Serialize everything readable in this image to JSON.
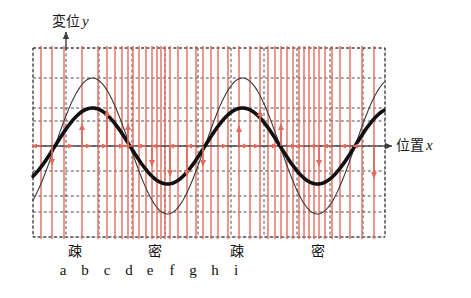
{
  "figure": {
    "axes": {
      "y_label_text": "変位",
      "y_label_var": "y",
      "x_label_text": "位置",
      "x_label_var": "x"
    },
    "colors": {
      "wave_thick": "#111111",
      "wave_thin": "#3a3a3a",
      "particle_red": "#e26a5c",
      "grid": "#3a3a3a",
      "axis": "#4a4a4a",
      "background": "#ffffff"
    },
    "density_labels": [
      {
        "text": "疎",
        "x": 75
      },
      {
        "text": "密",
        "x": 155
      },
      {
        "text": "疎",
        "x": 237
      },
      {
        "text": "密",
        "x": 318
      }
    ],
    "point_labels": [
      {
        "text": "a",
        "x": 63
      },
      {
        "text": "b",
        "x": 85
      },
      {
        "text": "c",
        "x": 107
      },
      {
        "text": "d",
        "x": 129
      },
      {
        "text": "e",
        "x": 150
      },
      {
        "text": "f",
        "x": 172
      },
      {
        "text": "g",
        "x": 193
      },
      {
        "text": "h",
        "x": 215
      },
      {
        "text": "i",
        "x": 236
      }
    ]
  },
  "chart_data": {
    "type": "line",
    "xlabel": "位置 x",
    "ylabel": "変位 y",
    "grid": true,
    "legend": "none",
    "plot_box": {
      "x0": 33,
      "y0": 48,
      "x1": 385,
      "y1": 237
    },
    "axis_y_zero": 146,
    "grid_x": [
      33,
      66,
      99,
      132,
      165,
      198,
      231,
      264,
      297,
      330,
      363,
      385
    ],
    "grid_y": [
      48,
      78,
      108,
      121,
      146,
      171,
      196,
      212,
      237
    ],
    "xlim": [
      0,
      2.1
    ],
    "ylim": [
      -1.3,
      1.45
    ],
    "series": [
      {
        "name": "displacement-thick",
        "style": "thick",
        "amplitude": 0.52,
        "wavelength_px": 150,
        "phase_px": 55,
        "y_baseline": 146,
        "amplitude_px": 38,
        "stroke": "#111111",
        "stroke_width": 3.6
      },
      {
        "name": "displacement-thin",
        "style": "thin",
        "amplitude": 1.0,
        "wavelength_px": 150,
        "phase_px": 55,
        "y_baseline": 146,
        "amplitude_px": 68,
        "stroke": "#3a3a3a",
        "stroke_width": 1.1
      }
    ],
    "particle_lines_x": [
      41,
      52,
      64,
      82,
      98,
      107,
      115,
      122,
      128,
      133,
      139,
      146,
      152,
      157,
      161,
      165,
      170,
      178,
      187,
      196,
      203,
      211,
      218,
      228,
      239,
      250,
      260,
      268,
      275,
      281,
      287,
      293,
      299,
      304,
      309,
      314,
      319,
      325,
      332,
      340,
      350,
      362,
      374
    ],
    "vertical_arrows": [
      {
        "x": 52,
        "y_start": 146,
        "y_end": 165,
        "dir": "down"
      },
      {
        "x": 82,
        "y_start": 146,
        "y_end": 124,
        "dir": "up"
      },
      {
        "x": 107,
        "y_start": 146,
        "y_end": 110,
        "dir": "up"
      },
      {
        "x": 128,
        "y_start": 146,
        "y_end": 124,
        "dir": "up"
      },
      {
        "x": 152,
        "y_start": 146,
        "y_end": 166,
        "dir": "down"
      },
      {
        "x": 170,
        "y_start": 146,
        "y_end": 176,
        "dir": "down"
      },
      {
        "x": 187,
        "y_start": 146,
        "y_end": 176,
        "dir": "down"
      },
      {
        "x": 203,
        "y_start": 146,
        "y_end": 166,
        "dir": "down"
      },
      {
        "x": 239,
        "y_start": 146,
        "y_end": 126,
        "dir": "up"
      },
      {
        "x": 260,
        "y_start": 146,
        "y_end": 110,
        "dir": "up"
      },
      {
        "x": 281,
        "y_start": 146,
        "y_end": 124,
        "dir": "up"
      },
      {
        "x": 319,
        "y_start": 146,
        "y_end": 166,
        "dir": "down"
      },
      {
        "x": 374,
        "y_start": 146,
        "y_end": 178,
        "dir": "down"
      }
    ],
    "horizontal_arrows": [
      {
        "x": 41,
        "dir": "left"
      },
      {
        "x": 64,
        "dir": "right"
      },
      {
        "x": 82,
        "dir": "right"
      },
      {
        "x": 98,
        "dir": "right"
      },
      {
        "x": 115,
        "dir": "right"
      },
      {
        "x": 133,
        "dir": "left"
      },
      {
        "x": 146,
        "dir": "left"
      },
      {
        "x": 161,
        "dir": "left"
      },
      {
        "x": 178,
        "dir": "left"
      },
      {
        "x": 196,
        "dir": "left"
      },
      {
        "x": 218,
        "dir": "right"
      },
      {
        "x": 239,
        "dir": "right"
      },
      {
        "x": 250,
        "dir": "right"
      },
      {
        "x": 268,
        "dir": "right"
      },
      {
        "x": 287,
        "dir": "right"
      },
      {
        "x": 304,
        "dir": "left"
      },
      {
        "x": 319,
        "dir": "left"
      },
      {
        "x": 332,
        "dir": "left"
      },
      {
        "x": 350,
        "dir": "left"
      },
      {
        "x": 362,
        "dir": "left"
      }
    ]
  }
}
